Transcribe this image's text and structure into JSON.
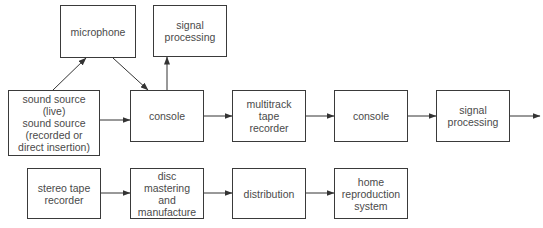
{
  "diagram": {
    "type": "signal-flow block diagram",
    "line_color": "#333333",
    "text_color": "#4a4a4a",
    "nodes": {
      "microphone": "microphone",
      "signal_processing_1": "signal\nprocessing",
      "sound_source": "sound source\n(live)\nsound source\n(recorded or\ndirect insertion)",
      "console_1": "console",
      "multitrack": "multitrack\ntape\nrecorder",
      "console_2": "console",
      "signal_processing_2": "signal\nprocessing",
      "stereo_tape": "stereo tape\nrecorder",
      "disc_mastering": "disc\nmastering\nand\nmanufacture",
      "distribution": "distribution",
      "home_reproduction": "home\nreproduction\nsystem"
    },
    "edges": [
      {
        "from": "sound_source",
        "to": "microphone"
      },
      {
        "from": "microphone",
        "to": "console_1"
      },
      {
        "from": "sound_source",
        "to": "console_1"
      },
      {
        "from": "console_1",
        "to": "signal_processing_1"
      },
      {
        "from": "console_1",
        "to": "multitrack"
      },
      {
        "from": "multitrack",
        "to": "console_2"
      },
      {
        "from": "console_2",
        "to": "signal_processing_2"
      },
      {
        "from": "signal_processing_2",
        "to": "output"
      },
      {
        "from": "stereo_tape",
        "to": "disc_mastering"
      },
      {
        "from": "disc_mastering",
        "to": "distribution"
      },
      {
        "from": "distribution",
        "to": "home_reproduction"
      }
    ]
  }
}
